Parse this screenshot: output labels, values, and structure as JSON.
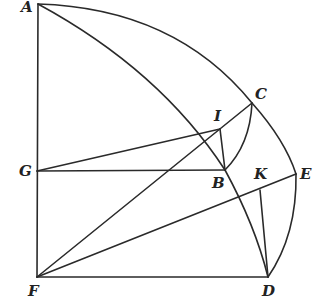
{
  "diagram": {
    "type": "geometry-construction",
    "points": [
      {
        "name": "A",
        "x": 38,
        "y": 4
      },
      {
        "name": "C",
        "x": 252,
        "y": 103
      },
      {
        "name": "I",
        "x": 220,
        "y": 129
      },
      {
        "name": "G",
        "x": 37,
        "y": 171
      },
      {
        "name": "B",
        "x": 225,
        "y": 170
      },
      {
        "name": "K",
        "x": 260,
        "y": 190
      },
      {
        "name": "E",
        "x": 296,
        "y": 174
      },
      {
        "name": "F",
        "x": 37,
        "y": 277
      },
      {
        "name": "D",
        "x": 268,
        "y": 277
      }
    ],
    "labels": {
      "A": "A",
      "C": "C",
      "I": "I",
      "G": "G",
      "B": "B",
      "K": "K",
      "E": "E",
      "F": "F",
      "D": "D"
    },
    "segments": [
      [
        "A",
        "F"
      ],
      [
        "F",
        "D"
      ],
      [
        "G",
        "B"
      ],
      [
        "G",
        "I"
      ],
      [
        "F",
        "C"
      ],
      [
        "F",
        "E"
      ],
      [
        "I",
        "B"
      ],
      [
        "K",
        "D"
      ]
    ],
    "arcs": [
      {
        "from": "A",
        "via": "C",
        "to": "E",
        "desc": "outer arc"
      },
      {
        "from": "A",
        "via": "B",
        "to": "D",
        "desc": "inner arc"
      },
      {
        "from": "C",
        "to": "B",
        "desc": "small arc"
      },
      {
        "from": "E",
        "to": "D",
        "desc": "right arc"
      }
    ],
    "stroke_color": "#2a2a2a"
  }
}
